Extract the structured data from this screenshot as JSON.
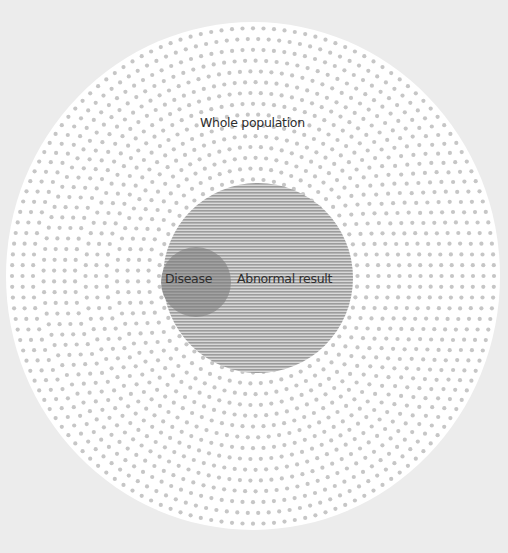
{
  "diagram": {
    "type": "nested-set",
    "sets": [
      {
        "id": "whole-population",
        "label": "Whole population",
        "fill": "dotted",
        "dot_color": "#c6c6c6",
        "background": "#ffffff"
      },
      {
        "id": "abnormal-result",
        "label": "Abnormal result",
        "fill": "horizontal-stripes",
        "stripe_color": "#9c9c9c"
      },
      {
        "id": "disease",
        "label": "Disease",
        "fill": "solid-dark-stripes",
        "color": "#8e8e8e"
      }
    ]
  },
  "labels": {
    "whole": "Whole population",
    "abnormal": "Abnormal result",
    "disease": "Disease"
  },
  "colors": {
    "page_background": "#ececec",
    "outer_circle": "#ffffff",
    "dots": "#c6c6c6",
    "stripes_dark": "#9c9c9c",
    "stripes_light": "#d6d6d6",
    "disease": "#8e8e8e",
    "text": "#2e2e2e"
  }
}
